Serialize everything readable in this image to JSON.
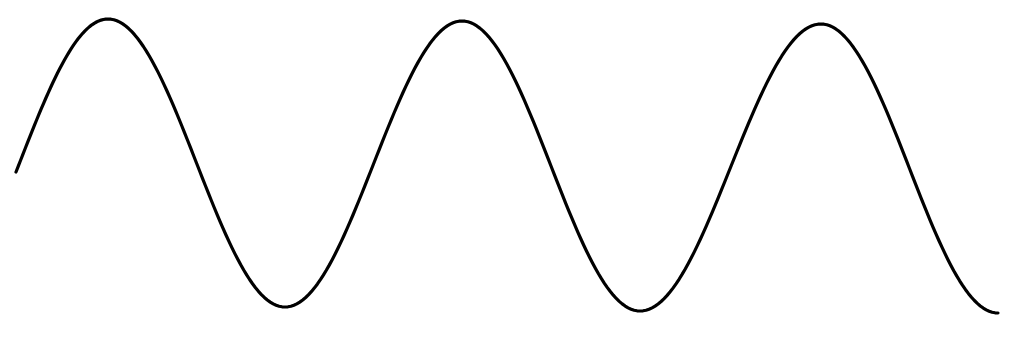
{
  "diagram": {
    "label": "Sine wave",
    "background": "#ffffff",
    "stroke_color": "#000000",
    "stroke_width": 3.2,
    "width": 1017,
    "height": 337,
    "key_points": [
      {
        "name": "start",
        "x": 16,
        "y": 172
      },
      {
        "name": "peak-1",
        "x": 108,
        "y": 19
      },
      {
        "name": "trough-1",
        "x": 285,
        "y": 307
      },
      {
        "name": "peak-2",
        "x": 462,
        "y": 21
      },
      {
        "name": "trough-2",
        "x": 640,
        "y": 311
      },
      {
        "name": "peak-3",
        "x": 821,
        "y": 24
      },
      {
        "name": "end",
        "x": 998,
        "y": 313
      }
    ],
    "period_px": 356,
    "cycles_visible": 2.75
  }
}
